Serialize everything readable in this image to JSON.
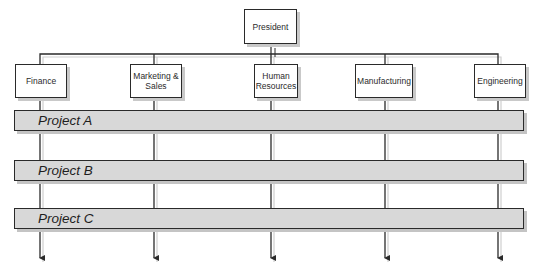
{
  "diagram": {
    "type": "matrix-organization-chart",
    "top": {
      "label": "President"
    },
    "departments": [
      {
        "label": "Finance"
      },
      {
        "label": "Marketing & Sales"
      },
      {
        "label": "Human Resources"
      },
      {
        "label": "Manufacturing"
      },
      {
        "label": "Engineering"
      }
    ],
    "projects": [
      {
        "label": "Project A"
      },
      {
        "label": "Project B"
      },
      {
        "label": "Project C"
      }
    ],
    "colors": {
      "line": "#2a2a2a",
      "box_fill": "#ffffff",
      "project_bar_fill": "#d8d8d8",
      "shadow": "#c6c6c6"
    }
  }
}
